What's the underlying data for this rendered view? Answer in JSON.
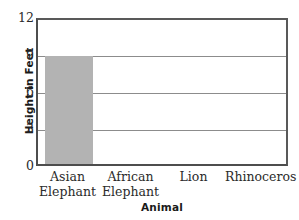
{
  "chart_data": {
    "type": "bar",
    "title": "",
    "xlabel": "Animal",
    "ylabel": "Height in Feet",
    "categories": [
      "Asian Elephant",
      "African Elephant",
      "Lion",
      "Rhinoceros"
    ],
    "category_lines": [
      [
        "Asian",
        "Elephant"
      ],
      [
        "African",
        "Elephant"
      ],
      [
        "Lion"
      ],
      [
        "Rhinoceros"
      ]
    ],
    "values": [
      9,
      null,
      null,
      null
    ],
    "ylim": [
      0,
      12
    ],
    "yticks": [
      0,
      3,
      6,
      9,
      12
    ],
    "ytick_labels": [
      "0",
      "3",
      "6",
      "9",
      "12"
    ],
    "grid": true,
    "gridlines_at": [
      3,
      6,
      9
    ],
    "legend": "none",
    "bar_color": "#b3b3b3",
    "axis_color": "#4d4d4d",
    "grid_color": "#8c8c8c",
    "text_color": "#2b2b2b"
  }
}
